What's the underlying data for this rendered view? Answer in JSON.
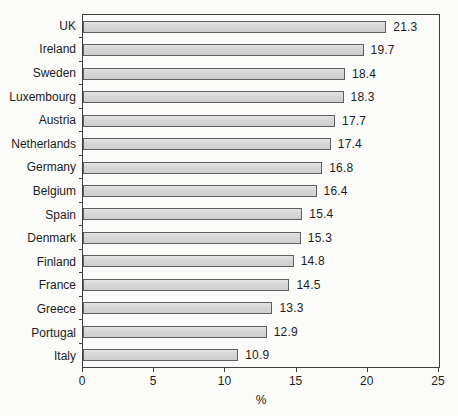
{
  "chart_data": {
    "type": "bar",
    "orientation": "horizontal",
    "title": "",
    "categories": [
      "UK",
      "Ireland",
      "Sweden",
      "Luxembourg",
      "Austria",
      "Netherlands",
      "Germany",
      "Belgium",
      "Spain",
      "Denmark",
      "Finland",
      "France",
      "Greece",
      "Portugal",
      "Italy"
    ],
    "values": [
      21.3,
      19.7,
      18.4,
      18.3,
      17.7,
      17.4,
      16.8,
      16.4,
      15.4,
      15.3,
      14.8,
      14.5,
      13.3,
      12.9,
      10.9
    ],
    "value_labels": [
      "21.3",
      "19.7",
      "18.4",
      "18.3",
      "17.7",
      "17.4",
      "16.8",
      "16.4",
      "15.4",
      "15.3",
      "14.8",
      "14.5",
      "13.3",
      "12.9",
      "10.9"
    ],
    "xlabel": "%",
    "ylabel": "",
    "xlim": [
      0,
      25
    ],
    "xticks": [
      "0",
      "5",
      "10",
      "15",
      "20",
      "25"
    ],
    "grid": false,
    "legend": null,
    "colors": {
      "bar_fill": "#d8d8d8",
      "bar_border": "#5f5f5f",
      "frame": "#3f3f3f",
      "text": "#1c1c1c",
      "background": "#fbfbfa"
    }
  }
}
